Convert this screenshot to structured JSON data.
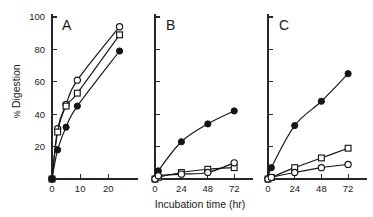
{
  "figure": {
    "ylabel": "% Digestion",
    "ylabel_percent_glyph": "%",
    "ylabel_text": "Digestion",
    "xlabel": "Incubation  time (hr)",
    "background": "#ffffff",
    "ink_color": "#161616"
  },
  "chart_data": {
    "type": "line",
    "title": "",
    "xlabel": "Incubation time (hr)",
    "ylabel": "% Digestion",
    "ylim": [
      0,
      100
    ],
    "yticks": [
      20,
      40,
      60,
      80,
      100
    ],
    "grid": false,
    "legend": "none",
    "panels": [
      {
        "label": "A",
        "xlim": [
          0,
          27
        ],
        "xticks": [
          0,
          10,
          20
        ],
        "series": [
          {
            "name": "open-circle",
            "marker": "open-circle",
            "x": [
              0,
              2,
              5,
              9,
              24
            ],
            "y": [
              0,
              31,
              46,
              61,
              94
            ]
          },
          {
            "name": "open-square",
            "marker": "open-square",
            "x": [
              0,
              2,
              5,
              9,
              24
            ],
            "y": [
              0,
              29,
              45,
              53,
              89
            ]
          },
          {
            "name": "filled-circle",
            "marker": "filled-circle",
            "x": [
              0,
              2,
              5,
              9,
              24
            ],
            "y": [
              0,
              18,
              32,
              45,
              79
            ]
          }
        ]
      },
      {
        "label": "B",
        "xlim": [
          0,
          80
        ],
        "xticks": [
          0,
          24,
          48,
          72
        ],
        "series": [
          {
            "name": "filled-circle",
            "marker": "filled-circle",
            "x": [
              0,
              3,
              24,
              48,
              72
            ],
            "y": [
              0,
              5,
              23,
              34,
              42
            ]
          },
          {
            "name": "open-square",
            "marker": "open-square",
            "x": [
              0,
              3,
              24,
              48,
              72
            ],
            "y": [
              0,
              1,
              4,
              6,
              7
            ]
          },
          {
            "name": "open-circle",
            "marker": "open-circle",
            "x": [
              0,
              3,
              24,
              48,
              72
            ],
            "y": [
              0,
              2,
              3,
              4,
              10
            ]
          }
        ]
      },
      {
        "label": "C",
        "xlim": [
          0,
          80
        ],
        "xticks": [
          0,
          24,
          48,
          72
        ],
        "series": [
          {
            "name": "filled-circle",
            "marker": "filled-circle",
            "x": [
              0,
              3,
              24,
              48,
              72
            ],
            "y": [
              0,
              7,
              33,
              48,
              65
            ]
          },
          {
            "name": "open-square",
            "marker": "open-square",
            "x": [
              0,
              3,
              24,
              48,
              72
            ],
            "y": [
              0,
              1,
              7,
              13,
              19
            ]
          },
          {
            "name": "open-circle",
            "marker": "open-circle",
            "x": [
              0,
              3,
              24,
              48,
              72
            ],
            "y": [
              0,
              1,
              4,
              7,
              9
            ]
          }
        ]
      }
    ]
  }
}
